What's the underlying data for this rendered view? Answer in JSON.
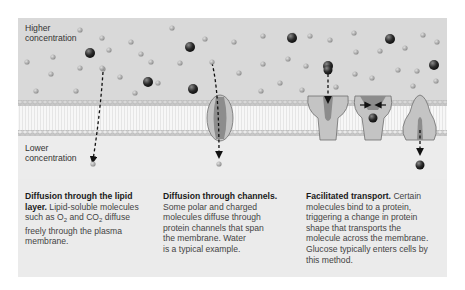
{
  "figure": {
    "labels": {
      "higher": [
        "Higher",
        "concentration"
      ],
      "lower": [
        "Lower",
        "concentration"
      ]
    },
    "captions": [
      {
        "title": "Diffusion through the lipid layer.",
        "title_line1": "Diffusion through the lipid",
        "title_line2": "layer.",
        "body_line1": " Lipid-soluble molecules",
        "body_line2_a": "such as O",
        "body_line2_sub1": "2",
        "body_line2_b": " and CO",
        "body_line2_sub2": "2",
        "body_line2_c": "  diffuse",
        "body_line3": "freely through the plasma",
        "body_line4": "membrane."
      },
      {
        "title": "Diffusion through channels.",
        "lines": [
          "Some polar and charged",
          "molecules diffuse through",
          "protein channels that span",
          "the membrane. Water",
          "is a typical example."
        ]
      },
      {
        "title": "Facilitated transport.",
        "title_tail": " Certain",
        "lines": [
          "molecules bind to a protein,",
          "triggering a change in protein",
          "shape that transports the",
          "molecule across the membrane.",
          "Glucose typically enters cells by",
          "this method."
        ]
      }
    ],
    "colors": {
      "upper_region": "#d9d9d9",
      "membrane_core": "#f7f7f7",
      "lower_region": "#ececec",
      "small_molecule": "#9a9a9a",
      "large_molecule": "#2e2e2e",
      "protein": "#bdbdbd",
      "protein_core": "#7d7d7d"
    }
  }
}
